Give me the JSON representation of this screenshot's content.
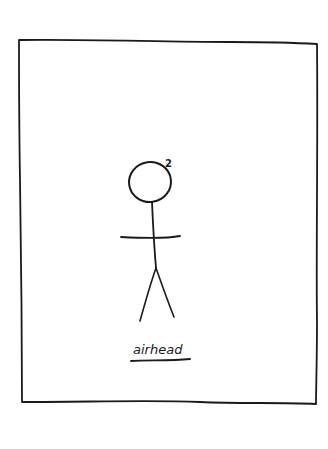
{
  "comic": {
    "caption": "airhead",
    "superscript": "2",
    "colors": {
      "ink": "#1a1a1a",
      "background": "#ffffff"
    }
  }
}
